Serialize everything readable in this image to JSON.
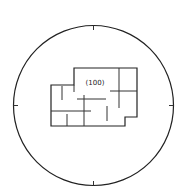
{
  "diagram": {
    "type": "crystal-face-projection",
    "face_label": "(100)",
    "colors": {
      "stroke": "#222222",
      "background": "#ffffff"
    },
    "circle": {
      "cx": 93.5,
      "cy": 105.5,
      "r": 80
    },
    "ticks": [
      {
        "position": "top",
        "x1": 93.5,
        "y1": 25.5,
        "x2": 93.5,
        "y2": 30
      },
      {
        "position": "bottom",
        "x1": 93.5,
        "y1": 185.5,
        "x2": 93.5,
        "y2": 181
      },
      {
        "position": "left",
        "x1": 13.5,
        "y1": 105.5,
        "x2": 18,
        "y2": 105.5
      },
      {
        "position": "right",
        "x1": 173.5,
        "y1": 105.5,
        "x2": 169,
        "y2": 105.5
      }
    ],
    "outline_points": "51,85 74,85 74,68 137,68 137,117 125,117 125,126 51,126",
    "internal_lines": [
      {
        "x1": 74,
        "y1": 85,
        "x2": 74,
        "y2": 92
      },
      {
        "x1": 62,
        "y1": 86,
        "x2": 62,
        "y2": 100
      },
      {
        "x1": 51,
        "y1": 111,
        "x2": 91,
        "y2": 111
      },
      {
        "x1": 67,
        "y1": 114,
        "x2": 67,
        "y2": 126
      },
      {
        "x1": 84,
        "y1": 95,
        "x2": 84,
        "y2": 126
      },
      {
        "x1": 77,
        "y1": 99,
        "x2": 106,
        "y2": 99
      },
      {
        "x1": 107,
        "y1": 106,
        "x2": 107,
        "y2": 121
      },
      {
        "x1": 119,
        "y1": 68,
        "x2": 119,
        "y2": 108
      },
      {
        "x1": 110,
        "y1": 91,
        "x2": 137,
        "y2": 91
      }
    ],
    "label_position": {
      "x": 95,
      "y": 85
    }
  }
}
